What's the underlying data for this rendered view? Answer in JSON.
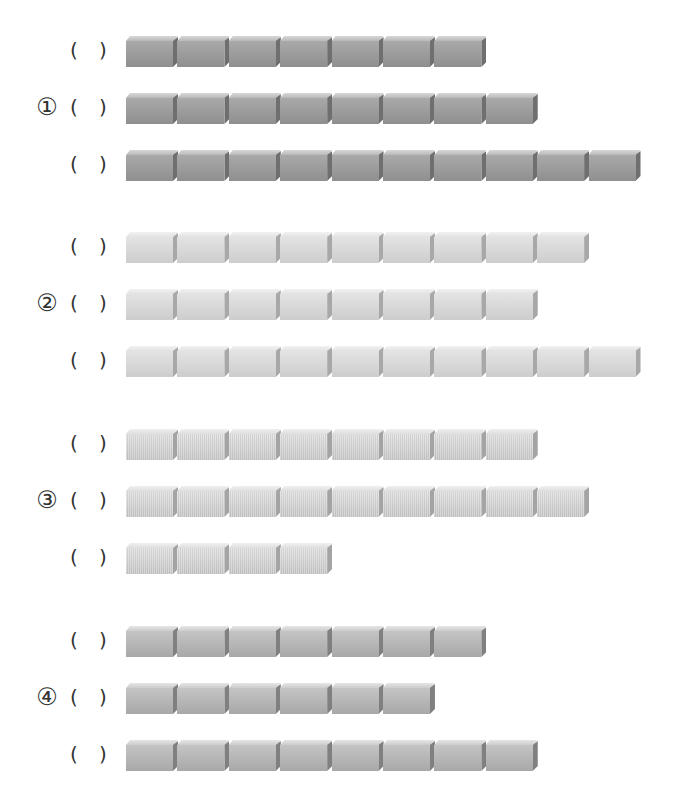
{
  "worksheet": {
    "groups": [
      {
        "label": "①",
        "style": "g1",
        "rows": [
          {
            "top": 36,
            "blocks": 7,
            "answer": ""
          },
          {
            "top": 93,
            "blocks": 8,
            "answer": ""
          },
          {
            "top": 150,
            "blocks": 10,
            "answer": ""
          }
        ]
      },
      {
        "label": "②",
        "style": "g2",
        "rows": [
          {
            "top": 232,
            "blocks": 9,
            "answer": ""
          },
          {
            "top": 289,
            "blocks": 8,
            "answer": ""
          },
          {
            "top": 346,
            "blocks": 10,
            "answer": ""
          }
        ]
      },
      {
        "label": "③",
        "style": "g3",
        "rows": [
          {
            "top": 429,
            "blocks": 8,
            "answer": ""
          },
          {
            "top": 486,
            "blocks": 9,
            "answer": ""
          },
          {
            "top": 543,
            "blocks": 4,
            "answer": ""
          }
        ]
      },
      {
        "label": "④",
        "style": "g4",
        "rows": [
          {
            "top": 626,
            "blocks": 7,
            "answer": ""
          },
          {
            "top": 683,
            "blocks": 6,
            "answer": ""
          },
          {
            "top": 740,
            "blocks": 8,
            "answer": ""
          }
        ]
      }
    ],
    "paren_open": "(",
    "paren_close": ")"
  }
}
